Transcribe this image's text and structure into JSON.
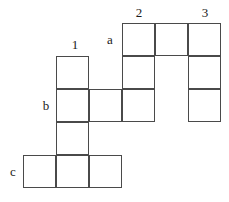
{
  "diagram": {
    "kind": "grid-puzzle-crossword-blank",
    "cell_size": 33,
    "line_color": "#4a4a4a",
    "background_color": "#ffffff",
    "text_color": "#1a1a1a",
    "column_labels": [
      {
        "id": "col-1",
        "text": "1",
        "x": 66,
        "y": 38
      },
      {
        "id": "col-2",
        "text": "2",
        "x": 130,
        "y": 6
      },
      {
        "id": "col-3",
        "text": "3",
        "x": 196,
        "y": 6
      }
    ],
    "row_labels": [
      {
        "id": "row-a",
        "text": "a",
        "x": 103,
        "y": 33
      },
      {
        "id": "row-b",
        "text": "b",
        "x": 39,
        "y": 99
      },
      {
        "id": "row-c",
        "text": "c",
        "x": 6,
        "y": 165
      }
    ],
    "cells": [
      {
        "id": "cell-a1",
        "x": 122,
        "y": 23,
        "w": 33,
        "h": 33
      },
      {
        "id": "cell-a2",
        "x": 155,
        "y": 23,
        "w": 33,
        "h": 33
      },
      {
        "id": "cell-a3",
        "x": 188,
        "y": 23,
        "w": 33,
        "h": 33
      },
      {
        "id": "cell-r2-c1",
        "x": 56,
        "y": 56,
        "w": 33,
        "h": 33
      },
      {
        "id": "cell-r2-c4",
        "x": 122,
        "y": 56,
        "w": 33,
        "h": 33
      },
      {
        "id": "cell-r2-c6",
        "x": 188,
        "y": 56,
        "w": 33,
        "h": 33
      },
      {
        "id": "cell-b1",
        "x": 56,
        "y": 89,
        "w": 33,
        "h": 33
      },
      {
        "id": "cell-b2",
        "x": 89,
        "y": 89,
        "w": 33,
        "h": 33
      },
      {
        "id": "cell-b3",
        "x": 122,
        "y": 89,
        "w": 33,
        "h": 33
      },
      {
        "id": "cell-b4",
        "x": 188,
        "y": 89,
        "w": 33,
        "h": 33
      },
      {
        "id": "cell-r4-c1",
        "x": 56,
        "y": 122,
        "w": 33,
        "h": 33
      },
      {
        "id": "cell-c1",
        "x": 23,
        "y": 155,
        "w": 33,
        "h": 33
      },
      {
        "id": "cell-c2",
        "x": 56,
        "y": 155,
        "w": 33,
        "h": 33
      },
      {
        "id": "cell-c3",
        "x": 89,
        "y": 155,
        "w": 33,
        "h": 33
      }
    ]
  }
}
